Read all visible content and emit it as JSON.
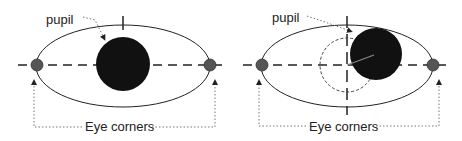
{
  "diagram": {
    "panels": [
      {
        "id": "centered",
        "pupil_label": "pupil",
        "corners_label": "Eye corners",
        "pupil_state": "centered"
      },
      {
        "id": "displaced",
        "pupil_label": "pupil",
        "corners_label": "Eye corners",
        "pupil_state": "displaced up-right with reference circle at center"
      }
    ],
    "colors": {
      "outline": "#222222",
      "pupil": "#111111",
      "eye_corner": "#555555",
      "background": "#ffffff"
    }
  }
}
